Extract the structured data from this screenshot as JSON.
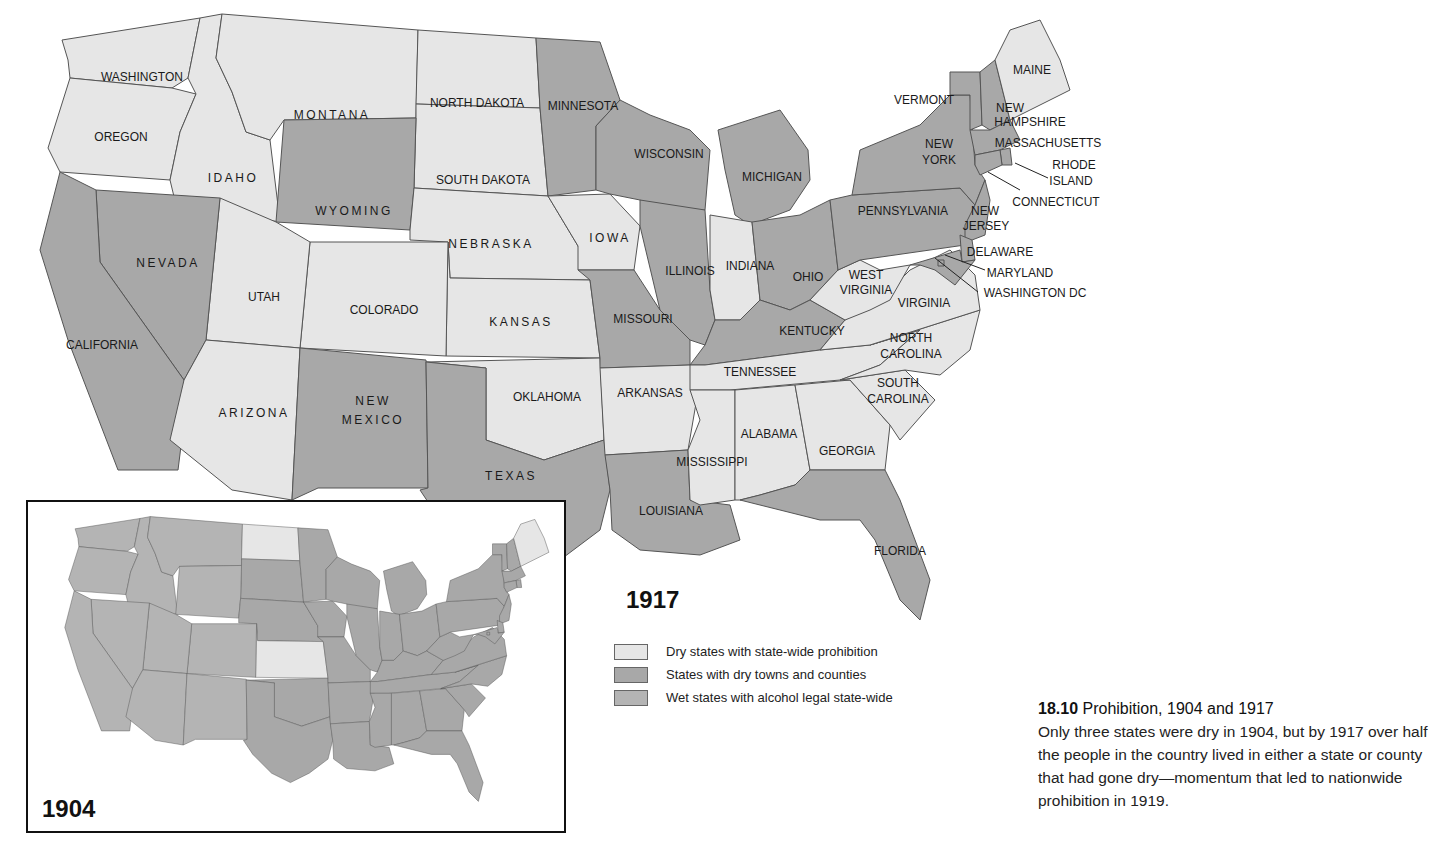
{
  "colors": {
    "dry": "#e6e6e6",
    "dry_towns": "#a8a8a8",
    "wet": "#b4b4b4",
    "water": "#ffffff",
    "border": "#555555"
  },
  "main_map": {
    "year": "1917",
    "states": {
      "WA": {
        "name": "WASHINGTON",
        "status": "dry"
      },
      "OR": {
        "name": "OREGON",
        "status": "dry"
      },
      "ID": {
        "name": "IDAHO",
        "status": "dry"
      },
      "MT": {
        "name": "MONTANA",
        "status": "dry"
      },
      "ND": {
        "name": "NORTH DAKOTA",
        "status": "dry"
      },
      "SD": {
        "name": "SOUTH DAKOTA",
        "status": "dry"
      },
      "WY": {
        "name": "WYOMING",
        "status": "dry_towns"
      },
      "NV": {
        "name": "NEVADA",
        "status": "dry_towns"
      },
      "CA": {
        "name": "CALIFORNIA",
        "status": "dry_towns"
      },
      "UT": {
        "name": "UTAH",
        "status": "dry"
      },
      "CO": {
        "name": "COLORADO",
        "status": "dry"
      },
      "AZ": {
        "name": "ARIZONA",
        "status": "dry"
      },
      "NM": {
        "name": "NEW MEXICO",
        "status": "dry_towns"
      },
      "NE": {
        "name": "NEBRASKA",
        "status": "dry"
      },
      "KS": {
        "name": "KANSAS",
        "status": "dry"
      },
      "OK": {
        "name": "OKLAHOMA",
        "status": "dry"
      },
      "TX": {
        "name": "TEXAS",
        "status": "dry_towns"
      },
      "MN": {
        "name": "MINNESOTA",
        "status": "dry_towns"
      },
      "IA": {
        "name": "IOWA",
        "status": "dry"
      },
      "MO": {
        "name": "MISSOURI",
        "status": "dry_towns"
      },
      "AR": {
        "name": "ARKANSAS",
        "status": "dry"
      },
      "LA": {
        "name": "LOUISIANA",
        "status": "dry_towns"
      },
      "WI": {
        "name": "WISCONSIN",
        "status": "dry_towns"
      },
      "IL": {
        "name": "ILLINOIS",
        "status": "dry_towns"
      },
      "MI": {
        "name": "MICHIGAN",
        "status": "dry_towns"
      },
      "IN": {
        "name": "INDIANA",
        "status": "dry"
      },
      "OH": {
        "name": "OHIO",
        "status": "dry_towns"
      },
      "KY": {
        "name": "KENTUCKY",
        "status": "dry_towns"
      },
      "TN": {
        "name": "TENNESSEE",
        "status": "dry"
      },
      "MS": {
        "name": "MISSISSIPPI",
        "status": "dry"
      },
      "AL": {
        "name": "ALABAMA",
        "status": "dry"
      },
      "GA": {
        "name": "GEORGIA",
        "status": "dry"
      },
      "FL": {
        "name": "FLORIDA",
        "status": "dry_towns"
      },
      "SC": {
        "name": "SOUTH CAROLINA",
        "status": "dry"
      },
      "NC": {
        "name": "NORTH CAROLINA",
        "status": "dry"
      },
      "VA": {
        "name": "VIRGINIA",
        "status": "dry"
      },
      "WV": {
        "name": "WEST VIRGINIA",
        "status": "dry"
      },
      "PA": {
        "name": "PENNSYLVANIA",
        "status": "dry_towns"
      },
      "NY": {
        "name": "NEW YORK",
        "status": "dry_towns"
      },
      "VT": {
        "name": "VERMONT",
        "status": "dry_towns"
      },
      "NH": {
        "name": "NEW HAMPSHIRE",
        "status": "dry_towns"
      },
      "ME": {
        "name": "MAINE",
        "status": "dry"
      },
      "MA": {
        "name": "MASSACHUSETTS",
        "status": "dry_towns"
      },
      "RI": {
        "name": "RHODE ISLAND",
        "status": "dry_towns"
      },
      "CT": {
        "name": "CONNECTICUT",
        "status": "dry_towns"
      },
      "NJ": {
        "name": "NEW JERSEY",
        "status": "dry_towns"
      },
      "DE": {
        "name": "DELAWARE",
        "status": "dry_towns"
      },
      "MD": {
        "name": "MARYLAND",
        "status": "dry_towns"
      },
      "DC": {
        "name": "WASHINGTON DC",
        "status": "dry_towns"
      }
    }
  },
  "inset_map": {
    "year": "1904",
    "dry_states": [
      "ND",
      "KS",
      "ME"
    ]
  },
  "legend": {
    "items": [
      {
        "key": "dry",
        "label": "Dry states with state-wide prohibition"
      },
      {
        "key": "dry_towns",
        "label": "States with dry towns and counties"
      },
      {
        "key": "wet",
        "label": "Wet states with alcohol legal state-wide"
      }
    ]
  },
  "caption": {
    "number": "18.10",
    "title": "Prohibition, 1904 and 1917",
    "body": "Only three states were dry in 1904, but by 1917 over half the people in the country lived in either a state or county that had gone dry—momentum that led to nationwide prohibition in 1919."
  }
}
